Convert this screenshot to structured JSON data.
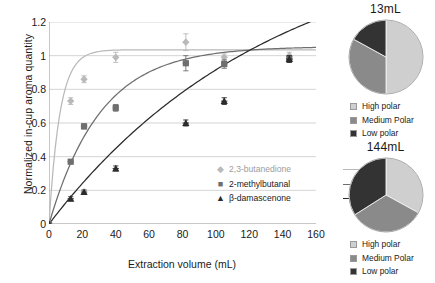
{
  "chart_data": [
    {
      "type": "scatter",
      "title": "",
      "xlabel": "Extraction volume (mL)",
      "ylabel": "Normalized in-cup aroma quantity",
      "xlim": [
        0,
        160
      ],
      "ylim": [
        0,
        1.2
      ],
      "xticks": [
        "0",
        "20",
        "40",
        "60",
        "80",
        "100",
        "120",
        "140",
        "160"
      ],
      "yticks": [
        "0",
        "0.2",
        "0.4",
        "0.6",
        "0.8",
        "1",
        "1.2"
      ],
      "grid": "horizontal",
      "legend_position": "inside-right",
      "series": [
        {
          "name": "2,3-butanedione",
          "marker": "diamond",
          "color": "#b9b9b9",
          "x": [
            0,
            13,
            21,
            40,
            82,
            105,
            144
          ],
          "values": [
            0.0,
            0.73,
            0.86,
            0.99,
            1.08,
            0.99,
            1.0
          ],
          "errors": [
            0.0,
            0.02,
            0.02,
            0.03,
            0.05,
            0.02,
            0.02
          ]
        },
        {
          "name": "2-methylbutanal",
          "marker": "square",
          "color": "#6e6e6e",
          "x": [
            0,
            13,
            21,
            40,
            82,
            105,
            144
          ],
          "values": [
            0.0,
            0.37,
            0.58,
            0.69,
            0.955,
            0.95,
            0.98
          ],
          "errors": [
            0.0,
            0.01,
            0.015,
            0.02,
            0.045,
            0.025,
            0.02
          ]
        },
        {
          "name": "β-damascenone",
          "marker": "triangle",
          "color": "#2b2b2b",
          "x": [
            0,
            13,
            21,
            40,
            82,
            105,
            144
          ],
          "values": [
            0.0,
            0.15,
            0.19,
            0.33,
            0.6,
            0.73,
            0.98
          ],
          "errors": [
            0.0,
            0.012,
            0.012,
            0.015,
            0.018,
            0.02,
            0.02
          ]
        }
      ]
    },
    {
      "type": "pie",
      "title": "13mL",
      "labels": [
        "High polar",
        "Medium Polar",
        "Low polar"
      ],
      "values": [
        50,
        33,
        17
      ],
      "colors": [
        "#cfcfcf",
        "#8a8a8a",
        "#333333"
      ],
      "legend_position": "bottom"
    },
    {
      "type": "pie",
      "title": "144mL",
      "labels": [
        "High polar",
        "Medium Polar",
        "Low polar"
      ],
      "values": [
        33,
        33,
        34
      ],
      "colors": [
        "#cfcfcf",
        "#8a8a8a",
        "#333333"
      ],
      "legend_position": "bottom"
    }
  ],
  "line_chart": {
    "ylabel": "Normalized in-cup aroma quantity",
    "xlabel": "Extraction volume (mL)",
    "yticks": [
      "1.2",
      "1",
      "0.8",
      "0.6",
      "0.4",
      "0.2",
      "0"
    ],
    "xticks": [
      "0",
      "20",
      "40",
      "60",
      "80",
      "100",
      "120",
      "140",
      "160"
    ],
    "legend": [
      {
        "label": "2,3-butanedione",
        "marker": "◆",
        "color": "#b9b9b9"
      },
      {
        "label": "2-methylbutanal",
        "marker": "■",
        "color": "#6e6e6e"
      },
      {
        "label": "β-damascenone",
        "marker": "▲",
        "color": "#2b2b2b"
      }
    ]
  },
  "pies": [
    {
      "title": "13mL",
      "legend": [
        {
          "label": "High polar",
          "color": "#cfcfcf"
        },
        {
          "label": "Medium Polar",
          "color": "#8a8a8a"
        },
        {
          "label": "Low polar",
          "color": "#333333"
        }
      ]
    },
    {
      "title": "144mL",
      "legend": [
        {
          "label": "High polar",
          "color": "#cfcfcf"
        },
        {
          "label": "Medium Polar",
          "color": "#8a8a8a"
        },
        {
          "label": "Low polar",
          "color": "#333333"
        }
      ]
    }
  ]
}
